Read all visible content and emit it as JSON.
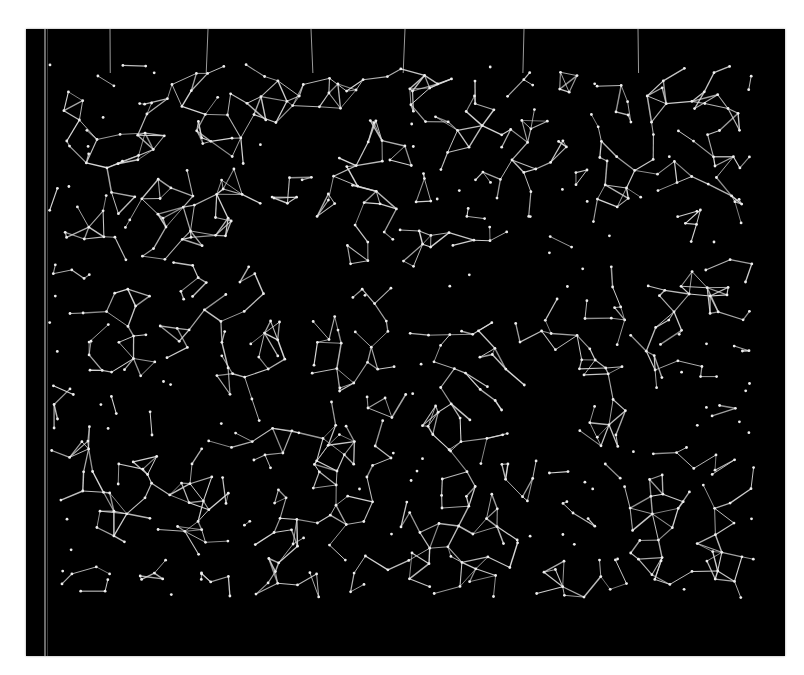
{
  "artwork": {
    "background": "#ffffff",
    "panel": {
      "x": 26,
      "y": 29,
      "width": 759,
      "height": 627,
      "color": "#000000"
    },
    "wire_color": "#d8d8d8",
    "node_color": "#eeeeee",
    "network_bounds": {
      "x0": 60,
      "y0": 75,
      "x1": 760,
      "y1": 600
    },
    "hanging_wires_x": [
      110,
      208,
      311,
      405,
      524,
      638
    ],
    "holes": [
      {
        "cx": 300,
        "cy": 260,
        "r": 46
      },
      {
        "cx": 310,
        "cy": 140,
        "r": 30
      },
      {
        "cx": 520,
        "cy": 280,
        "r": 40
      },
      {
        "cx": 650,
        "cy": 240,
        "r": 34
      },
      {
        "cx": 180,
        "cy": 420,
        "r": 30
      },
      {
        "cx": 545,
        "cy": 415,
        "r": 36
      },
      {
        "cx": 660,
        "cy": 420,
        "r": 30
      },
      {
        "cx": 420,
        "cy": 300,
        "r": 26
      },
      {
        "cx": 290,
        "cy": 400,
        "r": 24
      }
    ]
  }
}
